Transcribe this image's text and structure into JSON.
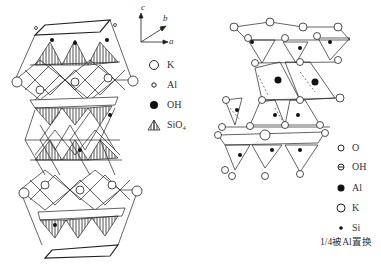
{
  "left_diagram": {
    "axes": {
      "c": "c",
      "b": "b",
      "a": "a"
    },
    "legend": [
      {
        "symbol": "large-open-circle",
        "label": "K"
      },
      {
        "symbol": "small-open-circle",
        "label": "Al"
      },
      {
        "symbol": "filled-circle",
        "label": "OH"
      },
      {
        "symbol": "hatched-tetrahedron",
        "label": "SiO₄"
      }
    ]
  },
  "right_diagram": {
    "legend": [
      {
        "symbol": "open-circle",
        "label": "O"
      },
      {
        "symbol": "barred-circle",
        "label": "OH"
      },
      {
        "symbol": "filled-circle",
        "label": "Al"
      },
      {
        "symbol": "large-open-circle",
        "label": "K"
      },
      {
        "symbol": "small-dot",
        "label": "Si"
      }
    ],
    "note": "1/4被Al置换"
  },
  "colors": {
    "line": "#222222",
    "background": "#ffffff"
  }
}
